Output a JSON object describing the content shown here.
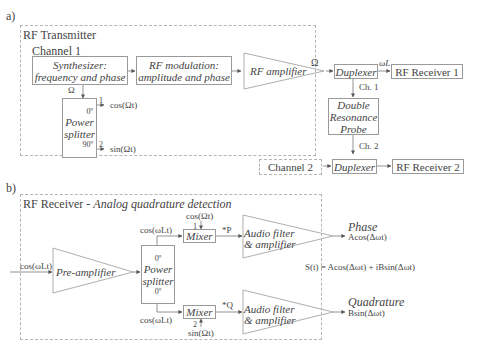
{
  "panel_a": {
    "label": "a)",
    "title": "RF Transmitter",
    "channel1": "Channel 1",
    "synth_line1": "Synthesizer:",
    "synth_line2": "frequency and phase",
    "rfmod_line1": "RF modulation:",
    "rfmod_line2": "amplitude and phase",
    "rf_amp": "RF amplifier",
    "omega": "Ω",
    "omega2": "Ω",
    "duplexer1": "Duplexer",
    "omega_L": "ωL",
    "receiver1": "RF Receiver 1",
    "ch1": "Ch. 1",
    "probe_line1": "Double",
    "probe_line2": "Resonance",
    "probe_line3": "Probe",
    "ch2": "Ch. 2",
    "channel2": "Channel 2",
    "duplexer2": "Duplexer",
    "receiver2": "RF Receiver 2",
    "splitter_deg0": "0º",
    "splitter_line1": "Power",
    "splitter_line2": "splitter",
    "splitter_deg90": "90º",
    "port1": "1",
    "port2": "2",
    "out_cos": "cos(Ωt)",
    "out_sin": "sin(Ωt)"
  },
  "panel_b": {
    "label": "b)",
    "title_plain": "RF Receiver - ",
    "title_italic": "Analog quadrature detection",
    "input_signal": "cos(ωLt)",
    "pre_amp": "Pre-amplifier",
    "splitter_deg_top": "0º",
    "splitter_line1": "Power",
    "splitter_line2": "splitter",
    "splitter_deg_bottom": "0º",
    "ref_top": "cos(ωLt)",
    "ref_bottom": "cos(ωLt)",
    "mixer_top": "Mixer",
    "mixer_bottom": "Mixer",
    "mixer_top_port": "1",
    "mixer_bottom_port": "2",
    "lo_top": "cos(Ωt)",
    "lo_bottom": "sin(Ωt)",
    "p_label": "*P",
    "q_label": "*Q",
    "filter_top_line1": "Audio filter",
    "filter_top_line2": "& amplifier",
    "filter_bottom_line1": "Audio filter",
    "filter_bottom_line2": "& amplifier",
    "phase_label": "Phase",
    "phase_out": "Acos(Δωt)",
    "quad_label": "Quadrature",
    "quad_out": "Bsin(Δωt)",
    "equation": "S(t) = Acos(Δωt) + iBsin(Δωt)"
  }
}
